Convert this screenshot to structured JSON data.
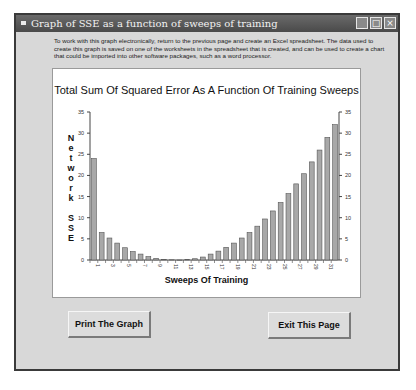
{
  "window": {
    "title": "Graph of SSE as a function of sweeps of training",
    "controls": {
      "minimize": "_",
      "maximize": "□",
      "close": "×"
    }
  },
  "intro_text": "To work with this graph electronically, return to the previous page and create an Excel spreadsheet.  The data used to create this graph is saved on one of the worksheets in the spreadsheet that is created, and can be used to create a chart that could be imported into other software packages, such as a word processor.",
  "buttons": {
    "print": "Print The Graph",
    "exit": "Exit This Page"
  },
  "chart_data": {
    "type": "bar",
    "title": "Total Sum Of Squared Error As A Function Of Training Sweeps",
    "xlabel": "Sweeps Of Training",
    "ylabel": "Network SSE",
    "ylabel_letters": [
      "N",
      "e",
      "t",
      "w",
      "o",
      "r",
      "k",
      "",
      "S",
      "S",
      "E"
    ],
    "ylim": [
      0,
      35
    ],
    "yticks": [
      0,
      5,
      10,
      15,
      20,
      25,
      30,
      35
    ],
    "y_axis_both_sides": true,
    "grid": false,
    "legend": null,
    "bar_color": "#a8a8a8",
    "categories": [
      1,
      2,
      3,
      4,
      5,
      6,
      7,
      8,
      9,
      10,
      11,
      12,
      13,
      14,
      15,
      16,
      17,
      18,
      19,
      20,
      21,
      22,
      23,
      24,
      25,
      26,
      27,
      28,
      29,
      30,
      31,
      32
    ],
    "x_tick_labels": [
      1,
      3,
      5,
      7,
      9,
      11,
      13,
      15,
      17,
      19,
      21,
      23,
      25,
      27,
      29,
      31
    ],
    "values": [
      24,
      6.5,
      5.2,
      4.0,
      2.9,
      2.0,
      1.4,
      0.8,
      0.4,
      0.15,
      0.05,
      0.0,
      0.1,
      0.3,
      0.7,
      1.4,
      2.1,
      3.0,
      4.0,
      5.2,
      6.5,
      8.0,
      9.7,
      11.6,
      13.6,
      15.7,
      18.0,
      20.4,
      23.2,
      26.0,
      29.0,
      32.0
    ]
  }
}
